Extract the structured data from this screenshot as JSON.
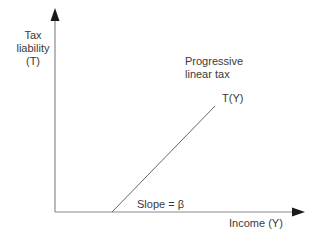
{
  "diagram": {
    "type": "economic-function-plot",
    "y_axis": {
      "label_lines": [
        "Tax",
        "liability",
        "(T)"
      ]
    },
    "x_axis": {
      "label": "Income (Y)"
    },
    "curve": {
      "label": "T(Y)",
      "start": [
        112,
        212
      ],
      "end": [
        215,
        106
      ]
    },
    "title_annotation": {
      "lines": [
        "Progressive",
        "linear tax"
      ]
    },
    "slope_annotation": "Slope = β",
    "colors": {
      "axis": "#8a8a8a",
      "arrowhead": "#1a1a1a",
      "curve": "#555555",
      "text": "#3a3a3a"
    }
  }
}
